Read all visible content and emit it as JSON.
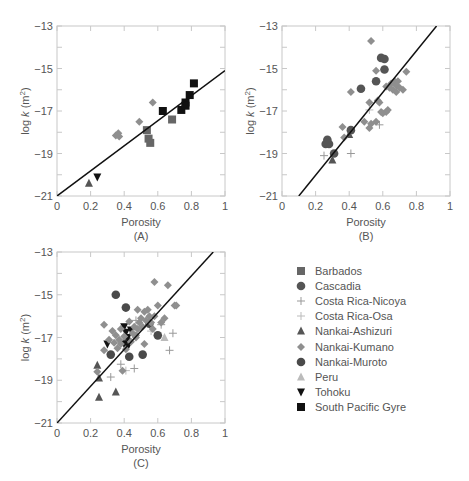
{
  "chart_data": [
    {
      "type": "scatter",
      "panel": "(A)",
      "xlabel": "Porosity",
      "ylabel": "log k (m2)",
      "xlim": [
        0,
        1
      ],
      "ylim": [
        -21,
        -13
      ],
      "xticks": [
        "0",
        "0.2",
        "0.4",
        "0.6",
        "0.8",
        "1"
      ],
      "yticks": [
        "-13",
        "-15",
        "-17",
        "-19",
        "-21"
      ],
      "fit_line": [
        [
          0,
          -21
        ],
        [
          1,
          -15.1
        ]
      ],
      "series": [
        {
          "name": "Nankai-Ashizuri",
          "points": [
            [
              0.19,
              -20.4
            ]
          ]
        },
        {
          "name": "Tohoku",
          "points": [
            [
              0.24,
              -20.1
            ]
          ]
        },
        {
          "name": "Nankai-Kumano",
          "points": [
            [
              0.35,
              -18.15
            ],
            [
              0.365,
              -18.05
            ],
            [
              0.37,
              -18.2
            ],
            [
              0.49,
              -17.5
            ],
            [
              0.57,
              -16.6
            ]
          ]
        },
        {
          "name": "Barbados",
          "points": [
            [
              0.535,
              -17.9
            ],
            [
              0.545,
              -18.3
            ],
            [
              0.555,
              -18.5
            ],
            [
              0.685,
              -17.4
            ]
          ]
        },
        {
          "name": "South Pacific Gyre",
          "points": [
            [
              0.63,
              -17.0
            ],
            [
              0.74,
              -16.95
            ],
            [
              0.765,
              -16.6
            ],
            [
              0.765,
              -16.75
            ],
            [
              0.79,
              -16.25
            ],
            [
              0.815,
              -15.7
            ]
          ]
        }
      ]
    },
    {
      "type": "scatter",
      "panel": "(B)",
      "xlabel": "Porosity",
      "ylabel": "log k (m2)",
      "xlim": [
        0,
        1
      ],
      "ylim": [
        -21,
        -13
      ],
      "xticks": [
        "0",
        "0.2",
        "0.4",
        "0.6",
        "0.8",
        "1"
      ],
      "yticks": [
        "-13",
        "-15",
        "-17",
        "-19",
        "-21"
      ],
      "fit_line": [
        [
          0.1,
          -21
        ],
        [
          0.92,
          -13
        ]
      ],
      "series": [
        {
          "name": "Cascadia",
          "points": [
            [
              0.27,
              -18.35
            ],
            [
              0.26,
              -18.55
            ],
            [
              0.28,
              -18.55
            ],
            [
              0.27,
              -18.5
            ],
            [
              0.31,
              -19.0
            ],
            [
              0.41,
              -17.9
            ],
            [
              0.47,
              -15.95
            ],
            [
              0.56,
              -15.6
            ],
            [
              0.59,
              -14.5
            ],
            [
              0.61,
              -14.55
            ],
            [
              0.61,
              -15.05
            ]
          ]
        },
        {
          "name": "Nankai-Ashizuri",
          "points": [
            [
              0.3,
              -19.3
            ],
            [
              0.4,
              -18.1
            ]
          ]
        },
        {
          "name": "Costa Rica-Nicoya",
          "points": [
            [
              0.25,
              -19.1
            ],
            [
              0.41,
              -19.0
            ],
            [
              0.58,
              -17.65
            ]
          ]
        },
        {
          "name": "Costa Rica-Osa",
          "points": [
            [
              0.52,
              -16.95
            ]
          ]
        },
        {
          "name": "Nankai-Kumano",
          "points": [
            [
              0.53,
              -13.7
            ],
            [
              0.56,
              -15.1
            ],
            [
              0.41,
              -16.1
            ],
            [
              0.36,
              -17.75
            ],
            [
              0.37,
              -18.25
            ],
            [
              0.49,
              -17.5
            ],
            [
              0.52,
              -16.6
            ],
            [
              0.52,
              -17.8
            ],
            [
              0.53,
              -17.6
            ],
            [
              0.56,
              -17.5
            ],
            [
              0.57,
              -16.5
            ],
            [
              0.58,
              -16.6
            ],
            [
              0.59,
              -17.05
            ],
            [
              0.6,
              -17.1
            ],
            [
              0.62,
              -17.05
            ],
            [
              0.63,
              -16.95
            ],
            [
              0.62,
              -15.85
            ],
            [
              0.64,
              -15.9
            ],
            [
              0.65,
              -15.7
            ],
            [
              0.66,
              -16.0
            ],
            [
              0.67,
              -15.6
            ],
            [
              0.68,
              -15.8
            ],
            [
              0.69,
              -15.6
            ],
            [
              0.68,
              -16.1
            ],
            [
              0.7,
              -15.9
            ],
            [
              0.72,
              -16.0
            ],
            [
              0.74,
              -15.15
            ]
          ]
        }
      ]
    },
    {
      "type": "scatter",
      "panel": "(C)",
      "xlabel": "Porosity",
      "ylabel": "log k (m2)",
      "xlim": [
        0,
        1
      ],
      "ylim": [
        -21,
        -13
      ],
      "xticks": [
        "0",
        "0.2",
        "0.4",
        "0.6",
        "0.8",
        "1"
      ],
      "yticks": [
        "-13",
        "-15",
        "-17",
        "-19",
        "-21"
      ],
      "fit_line": [
        [
          0,
          -21
        ],
        [
          0.93,
          -13
        ]
      ],
      "series": [
        {
          "name": "Nankai-Muroto",
          "points": [
            [
              0.35,
              -15.0
            ],
            [
              0.41,
              -15.6
            ],
            [
              0.55,
              -16.35
            ],
            [
              0.6,
              -16.9
            ],
            [
              0.32,
              -17.8
            ],
            [
              0.43,
              -17.9
            ],
            [
              0.51,
              -17.8
            ],
            [
              0.42,
              -17.15
            ]
          ]
        },
        {
          "name": "Nankai-Ashizuri",
          "points": [
            [
              0.24,
              -18.3
            ],
            [
              0.25,
              -18.9
            ],
            [
              0.25,
              -19.8
            ],
            [
              0.35,
              -19.55
            ]
          ]
        },
        {
          "name": "Tohoku",
          "points": [
            [
              0.3,
              -17.3
            ],
            [
              0.4,
              -16.5
            ],
            [
              0.41,
              -16.75
            ],
            [
              0.44,
              -16.65
            ],
            [
              0.42,
              -17.0
            ],
            [
              0.4,
              -17.3
            ],
            [
              0.42,
              -17.45
            ]
          ]
        },
        {
          "name": "Costa Rica-Nicoya",
          "points": [
            [
              0.32,
              -18.85
            ],
            [
              0.38,
              -18.25
            ],
            [
              0.46,
              -18.45
            ],
            [
              0.62,
              -16.4
            ],
            [
              0.69,
              -16.8
            ],
            [
              0.67,
              -17.6
            ],
            [
              0.47,
              -16.2
            ]
          ]
        },
        {
          "name": "Costa Rica-Osa",
          "points": [
            [
              0.41,
              -18.55
            ],
            [
              0.56,
              -16.7
            ]
          ]
        },
        {
          "name": "Peru",
          "points": [
            [
              0.64,
              -17.0
            ]
          ]
        },
        {
          "name": "Nankai-Kumano",
          "points": [
            [
              0.58,
              -14.4
            ],
            [
              0.66,
              -14.55
            ],
            [
              0.28,
              -16.4
            ],
            [
              0.28,
              -17.6
            ],
            [
              0.24,
              -18.6
            ],
            [
              0.31,
              -17.1
            ],
            [
              0.33,
              -16.7
            ],
            [
              0.34,
              -17.25
            ],
            [
              0.35,
              -16.9
            ],
            [
              0.36,
              -17.5
            ],
            [
              0.37,
              -17.1
            ],
            [
              0.38,
              -16.6
            ],
            [
              0.38,
              -17.3
            ],
            [
              0.39,
              -18.55
            ],
            [
              0.4,
              -16.95
            ],
            [
              0.41,
              -17.55
            ],
            [
              0.43,
              -16.25
            ],
            [
              0.44,
              -17.2
            ],
            [
              0.45,
              -16.8
            ],
            [
              0.46,
              -16.5
            ],
            [
              0.47,
              -16.9
            ],
            [
              0.48,
              -15.7
            ],
            [
              0.48,
              -16.6
            ],
            [
              0.49,
              -16.3
            ],
            [
              0.5,
              -16.1
            ],
            [
              0.51,
              -16.5
            ],
            [
              0.52,
              -15.8
            ],
            [
              0.53,
              -16.2
            ],
            [
              0.54,
              -15.7
            ],
            [
              0.55,
              -16.0
            ],
            [
              0.56,
              -16.3
            ],
            [
              0.57,
              -16.6
            ],
            [
              0.58,
              -16.0
            ],
            [
              0.6,
              -15.5
            ],
            [
              0.62,
              -16.3
            ],
            [
              0.64,
              -16.1
            ],
            [
              0.7,
              -15.5
            ],
            [
              0.71,
              -15.5
            ],
            [
              0.47,
              -17.0
            ],
            [
              0.52,
              -17.3
            ]
          ]
        }
      ]
    }
  ],
  "legend": [
    {
      "name": "Barbados",
      "marker": "square",
      "color": "#666666"
    },
    {
      "name": "Cascadia",
      "marker": "circle",
      "color": "#555555"
    },
    {
      "name": "Costa Rica-Nicoya",
      "marker": "plus",
      "color": "#999999"
    },
    {
      "name": "Costa Rica-Osa",
      "marker": "plus",
      "color": "#bbbbbb"
    },
    {
      "name": "Nankai-Ashizuri",
      "marker": "triangle-up",
      "color": "#555555"
    },
    {
      "name": "Nankai-Kumano",
      "marker": "diamond",
      "color": "#8f8f8f"
    },
    {
      "name": "Nankai-Muroto",
      "marker": "circle",
      "color": "#4a4a4a"
    },
    {
      "name": "Peru",
      "marker": "triangle-up",
      "color": "#bbbbbb"
    },
    {
      "name": "Tohoku",
      "marker": "triangle-down",
      "color": "#111111"
    },
    {
      "name": "South Pacific Gyre",
      "marker": "square",
      "color": "#111111"
    }
  ]
}
